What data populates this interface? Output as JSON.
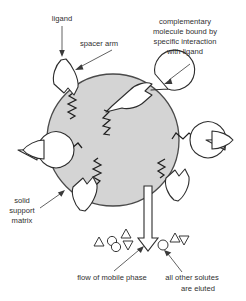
{
  "figure": {
    "background_color": "#ffffff",
    "bead_color": "#d4d4d4",
    "outline_color": "#2d2d2d",
    "text_color": "#2f2f2f"
  },
  "labels": {
    "ligand": "ligand",
    "spacer_arm": "spacer arm",
    "complementary_line1": "complementary",
    "complementary_line2": "molecule bound by",
    "complementary_line3": "specific interaction",
    "complementary_line4": "with ligand",
    "solid_line1": "solid",
    "solid_line2": "support",
    "solid_line3": "matrix",
    "flow_caption": "flow of mobile phase",
    "eluted_line1": "all other solutes",
    "eluted_line2": "are eluted"
  },
  "bead": {
    "center_x": 113,
    "center_y": 140,
    "radius": 66
  },
  "ligands": [
    {
      "name": "ligand-top-left",
      "angle_deg": 215,
      "bound": false
    },
    {
      "name": "ligand-upper-right",
      "angle_deg": 330,
      "bound": true
    },
    {
      "name": "ligand-left",
      "angle_deg": 178,
      "bound": true
    },
    {
      "name": "ligand-right",
      "angle_deg": 2,
      "bound": true
    },
    {
      "name": "ligand-bottom-left",
      "angle_deg": 115,
      "bound": false
    },
    {
      "name": "ligand-bottom-right",
      "angle_deg": 55,
      "bound": false
    }
  ],
  "solutes": {
    "left_group": [
      {
        "shape": "triangle-up",
        "x": 99,
        "y": 243
      },
      {
        "shape": "circle",
        "x": 112,
        "y": 241
      },
      {
        "shape": "circle",
        "x": 116,
        "y": 247
      },
      {
        "shape": "triangle-up",
        "x": 126,
        "y": 234
      },
      {
        "shape": "triangle-down",
        "x": 128,
        "y": 245
      }
    ],
    "right_group": [
      {
        "shape": "circle",
        "x": 163,
        "y": 245
      },
      {
        "shape": "triangle-up",
        "x": 175,
        "y": 238
      },
      {
        "shape": "triangle-down",
        "x": 184,
        "y": 241
      }
    ]
  },
  "flow_arrow": {
    "shaft_x": 148,
    "top_y": 186,
    "tip_y": 251
  }
}
